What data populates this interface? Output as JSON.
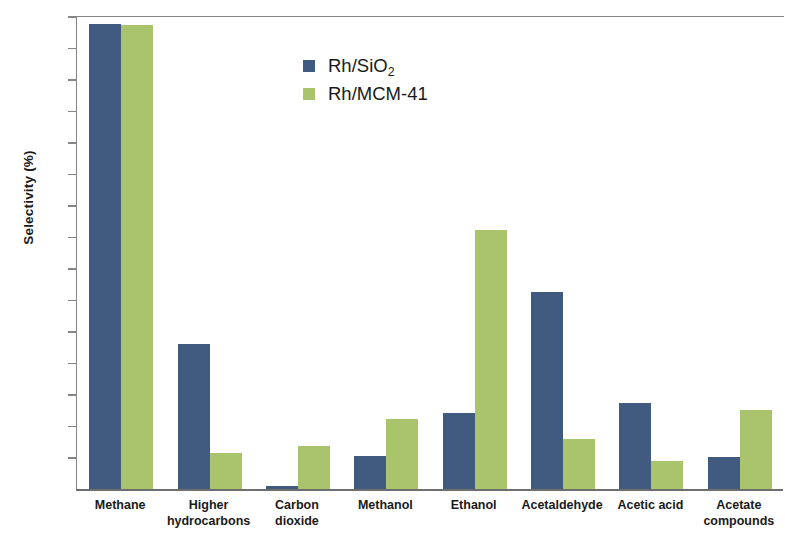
{
  "chart_data": {
    "type": "bar",
    "title": "",
    "xlabel": "",
    "ylabel": "Selectivity (%)",
    "ylim": [
      0,
      45
    ],
    "ytick_step": 3,
    "yticks": [
      45,
      42,
      39,
      36,
      33,
      30,
      27,
      24,
      21,
      18,
      15,
      12,
      9,
      6,
      3,
      0
    ],
    "grid": false,
    "legend_position": "top-center",
    "categories": [
      "Methane",
      "Higher hydrocarbons",
      "Carbon dioxide",
      "Methanol",
      "Ethanol",
      "Acetaldehyde",
      "Acetic acid",
      "Acetate compounds"
    ],
    "category_lines": [
      [
        "Methane"
      ],
      [
        "Higher",
        "hydrocarbons"
      ],
      [
        "Carbon",
        "dioxide"
      ],
      [
        "Methanol"
      ],
      [
        "Ethanol"
      ],
      [
        "Acetaldehyde"
      ],
      [
        "Acetic acid"
      ],
      [
        "Acetate",
        "compounds"
      ]
    ],
    "series": [
      {
        "name": "Rh/SiO2",
        "name_display": "Rh/SiO",
        "name_sub": "2",
        "color": "#415a7f",
        "values": [
          44.3,
          13.9,
          0.4,
          3.2,
          7.3,
          18.8,
          8.3,
          3.1
        ]
      },
      {
        "name": "Rh/MCM-41",
        "name_display": "Rh/MCM-41",
        "name_sub": "",
        "color": "#a9c46d",
        "values": [
          44.2,
          3.5,
          4.2,
          6.8,
          24.7,
          4.9,
          2.8,
          7.6
        ]
      }
    ]
  },
  "axis": {
    "y_title_main": "Selectivity (%)"
  },
  "legend": {
    "items": [
      {
        "label_main": "Rh/SiO",
        "label_sub": "2"
      },
      {
        "label_main": "Rh/MCM-41",
        "label_sub": ""
      }
    ]
  }
}
